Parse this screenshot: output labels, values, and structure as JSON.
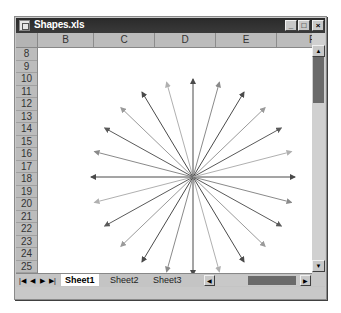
{
  "window": {
    "title": "Shapes.xls",
    "controls": {
      "minimize": "_",
      "maximize": "□",
      "close": "×"
    }
  },
  "columns": [
    "B",
    "C",
    "D",
    "E",
    "F"
  ],
  "rows": [
    "8",
    "9",
    "10",
    "11",
    "12",
    "13",
    "14",
    "15",
    "16",
    "17",
    "18",
    "19",
    "20",
    "21",
    "22",
    "23",
    "24",
    "25"
  ],
  "sheet_tabs": [
    {
      "label": "Sheet1",
      "active": true
    },
    {
      "label": "Sheet2",
      "active": false
    },
    {
      "label": "Sheet3",
      "active": false
    }
  ],
  "tab_nav": {
    "first": "|◀",
    "prev": "◀",
    "next": "▶",
    "last": "▶|"
  },
  "scroll": {
    "up": "▲",
    "down": "▼",
    "left": "◀",
    "right": "▶"
  },
  "shapes": {
    "center": [
      155,
      129
    ],
    "arrow_count": 24,
    "colors": [
      "#4a4a4a",
      "#5a5a5a",
      "#8a8a8a",
      "#9a9a9a",
      "#b0b0b0"
    ]
  }
}
